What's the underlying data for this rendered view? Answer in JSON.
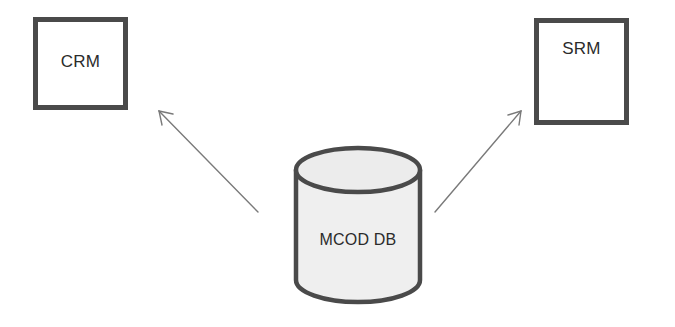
{
  "diagram": {
    "type": "architecture",
    "nodes": [
      {
        "id": "crm",
        "label": "CRM",
        "shape": "rectangle"
      },
      {
        "id": "srm",
        "label": "SRM",
        "shape": "rectangle"
      },
      {
        "id": "mcod_db",
        "label": "MCOD DB",
        "shape": "cylinder"
      }
    ],
    "edges": [
      {
        "from": "mcod_db",
        "to": "crm",
        "style": "arrow"
      },
      {
        "from": "mcod_db",
        "to": "srm",
        "style": "arrow"
      }
    ]
  },
  "colors": {
    "border": "#4a4a4a",
    "arrow": "#7a7a7a",
    "cylinder_fill": "#efefef",
    "text": "#2b2b2b"
  }
}
